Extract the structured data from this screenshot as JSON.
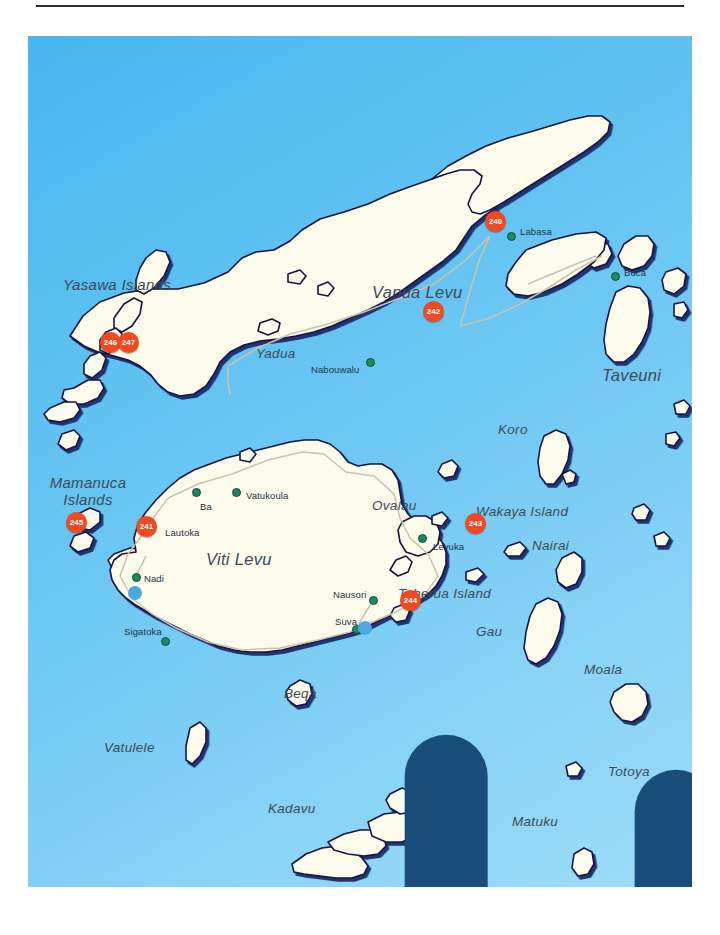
{
  "map": {
    "title": "Fiji Islands",
    "ocean_color": "#5cc0f2",
    "land_color": "#fdfbec",
    "land_outline_color": "#16163c",
    "land_shadow_color": "#1b2a6b",
    "road_color": "#c9c3ae",
    "marker_color": "#f04a22",
    "town_dot_color": "#1e8a63",
    "airport_color": "#49a9e0"
  },
  "islands": [
    {
      "name": "Yasawa Islands",
      "x": 64,
      "y": 246,
      "size": "two"
    },
    {
      "name": "Yadua",
      "x": 228,
      "y": 310,
      "size": "sm"
    },
    {
      "name": "Vanua Levu",
      "x": 372,
      "y": 253,
      "size": "big"
    },
    {
      "name": "Taveuni",
      "x": 602,
      "y": 338,
      "size": "big"
    },
    {
      "name": "Koro",
      "x": 494,
      "y": 392,
      "size": "sm"
    },
    {
      "name": "Mamanuca Islands",
      "x": 26,
      "y": 447,
      "size": "two"
    },
    {
      "name": "Ovalau",
      "x": 372,
      "y": 468,
      "size": "sm"
    },
    {
      "name": "Wakaya Island",
      "x": 462,
      "y": 474,
      "size": "sm"
    },
    {
      "name": "Nairai",
      "x": 528,
      "y": 508,
      "size": "sm"
    },
    {
      "name": "Viti Levu",
      "x": 207,
      "y": 522,
      "size": "big"
    },
    {
      "name": "Toberua Island",
      "x": 398,
      "y": 556,
      "size": "sm"
    },
    {
      "name": "Gau",
      "x": 475,
      "y": 594,
      "size": "sm"
    },
    {
      "name": "Moala",
      "x": 581,
      "y": 632,
      "size": "sm"
    },
    {
      "name": "Beqa",
      "x": 283,
      "y": 657,
      "size": "sm"
    },
    {
      "name": "Vatulele",
      "x": 105,
      "y": 710,
      "size": "sm"
    },
    {
      "name": "Totoya",
      "x": 610,
      "y": 734,
      "size": "sm"
    },
    {
      "name": "Kadavu",
      "x": 268,
      "y": 771,
      "size": "sm"
    },
    {
      "name": "Matuku",
      "x": 513,
      "y": 783,
      "size": "sm"
    }
  ],
  "towns": [
    {
      "name": "Labasa",
      "label_x": 489,
      "label_y": 191,
      "dot_x": 481,
      "dot_y": 198,
      "airport": false
    },
    {
      "name": "Buca",
      "label_x": 597,
      "label_y": 234,
      "dot_x": 585,
      "dot_y": 238,
      "airport": false
    },
    {
      "name": "Nabouwalu",
      "label_x": 286,
      "label_y": 330,
      "dot_x": 340,
      "dot_y": 325,
      "airport": false
    },
    {
      "name": "Vatukoula",
      "label_x": 216,
      "label_y": 456,
      "dot_x": 207,
      "dot_y": 456,
      "airport": false
    },
    {
      "name": "Ba",
      "label_x": 175,
      "label_y": 467,
      "dot_x": 167,
      "dot_y": 455,
      "airport": false
    },
    {
      "name": "Lautoka",
      "label_x": 138,
      "label_y": 493,
      "dot_x": null,
      "dot_y": null,
      "airport": false
    },
    {
      "name": "Levuka",
      "label_x": 407,
      "label_y": 508,
      "dot_x": 393,
      "dot_y": 501,
      "airport": false
    },
    {
      "name": "Nadi",
      "label_x": 115,
      "label_y": 541,
      "dot_x": 107,
      "dot_y": 541,
      "airport": true,
      "air_x": 105,
      "air_y": 551
    },
    {
      "name": "Nausori",
      "label_x": 307,
      "label_y": 555,
      "dot_x": 344,
      "dot_y": 564,
      "airport": false
    },
    {
      "name": "Suva",
      "label_x": 309,
      "label_y": 582,
      "dot_x": 327,
      "dot_y": 593,
      "airport": true,
      "air_x": 334,
      "air_y": 588
    },
    {
      "name": "Sigatoka",
      "label_x": 127,
      "label_y": 592,
      "dot_x": 136,
      "dot_y": 605,
      "airport": false
    }
  ],
  "markers": [
    {
      "id": "240",
      "x": 468,
      "y": 186,
      "group": false
    },
    {
      "id": "242",
      "x": 405,
      "y": 275,
      "group": false
    },
    {
      "id": "243",
      "x": 447,
      "y": 487,
      "group": false
    },
    {
      "id": "244",
      "x": 382,
      "y": 564,
      "group": false
    },
    {
      "id": "245",
      "x": 48,
      "y": 486,
      "group": false
    },
    {
      "id": "241",
      "x": 118,
      "y": 490,
      "group": false
    }
  ],
  "marker_pairs": [
    {
      "ids": [
        "246",
        "247"
      ],
      "x": 100,
      "y": 307
    }
  ]
}
